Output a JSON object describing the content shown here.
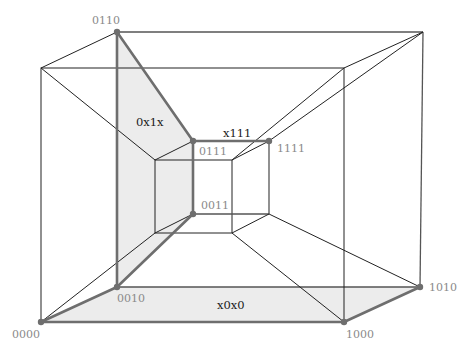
{
  "diagram": {
    "type": "tesseract-projection",
    "vertex_labels": {
      "v0110": "0110",
      "v0111": "0111",
      "v1111": "1111",
      "v0011": "0011",
      "v0010": "0010",
      "v0000": "0000",
      "v1000": "1000",
      "v1010": "1010"
    },
    "face_labels": {
      "f0x1x": "0x1x",
      "fx111": "x111",
      "fx0x0": "x0x0"
    },
    "colors": {
      "highlight_edge": "#6e6e6e",
      "highlight_face": "#ececec",
      "edge": "#222222",
      "label": "#8a8a8a"
    }
  }
}
